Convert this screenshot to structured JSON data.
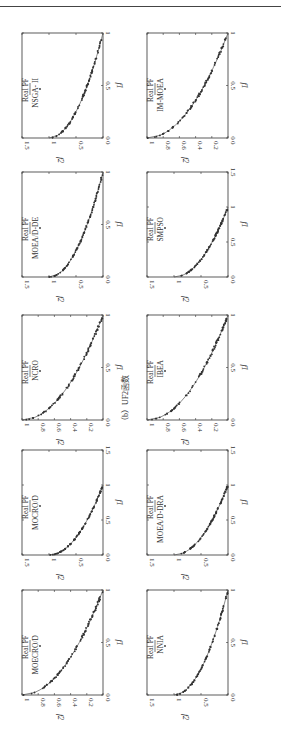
{
  "caption": "（b）UF2函数",
  "legend_line": "Real PF",
  "x_label": "f1",
  "y_label": "f2",
  "chart_data": [
    {
      "type": "scatter",
      "title": "NSGA-II",
      "legend": [
        "Real PF",
        "NSGA- II"
      ],
      "xlabel": "f1",
      "ylabel": "f2",
      "xlim": [
        0,
        1
      ],
      "ylim": [
        0,
        1.5
      ],
      "xticks": [
        "0",
        "0.5",
        "1"
      ],
      "yticks": [
        "0",
        "0.5",
        "1",
        "1.5"
      ]
    },
    {
      "type": "scatter",
      "title": "IM-MOEA",
      "legend": [
        "Real PF",
        "IM-MOEA"
      ],
      "xlabel": "f1",
      "ylabel": "f2",
      "xlim": [
        0,
        1
      ],
      "ylim": [
        0,
        1
      ],
      "xticks": [
        "0",
        "0.5",
        "1"
      ],
      "yticks": [
        "0",
        "0.2",
        "0.4",
        "0.6",
        "0.8",
        "1"
      ]
    },
    {
      "type": "scatter",
      "title": "MOEA/D-DE",
      "legend": [
        "Real PF",
        "MOEA/D-DE"
      ],
      "xlabel": "f1",
      "ylabel": "f2",
      "xlim": [
        0,
        1
      ],
      "ylim": [
        0,
        1.5
      ],
      "xticks": [
        "0",
        "0.5",
        "1"
      ],
      "yticks": [
        "0",
        "0.5",
        "1",
        "1.5"
      ]
    },
    {
      "type": "scatter",
      "title": "SMPSO",
      "legend": [
        "Real PF",
        "SMPSO"
      ],
      "xlabel": "f1",
      "ylabel": "f2",
      "xlim": [
        0,
        1.5
      ],
      "ylim": [
        0,
        1.5
      ],
      "xticks": [
        "0",
        "0.5",
        "1",
        "1.5"
      ],
      "yticks": [
        "0",
        "0.5",
        "1",
        "1.5"
      ]
    },
    {
      "type": "scatter",
      "title": "NCRO",
      "legend": [
        "Real PF",
        "NCRO"
      ],
      "xlabel": "f1",
      "ylabel": "f2",
      "xlim": [
        0,
        1
      ],
      "ylim": [
        0,
        1
      ],
      "xticks": [
        "0",
        "0.5",
        "1"
      ],
      "yticks": [
        "0",
        "0.2",
        "0.4",
        "0.6",
        "0.8",
        "1"
      ]
    },
    {
      "type": "scatter",
      "title": "IBEA",
      "legend": [
        "Real PF",
        "IBEA"
      ],
      "xlabel": "f1",
      "ylabel": "f2",
      "xlim": [
        0,
        1
      ],
      "ylim": [
        0,
        1
      ],
      "xticks": [
        "0",
        "0.5",
        "1"
      ],
      "yticks": [
        "0",
        "0.2",
        "0.4",
        "0.6",
        "0.8",
        "1"
      ]
    },
    {
      "type": "scatter",
      "title": "MOCRO/D",
      "legend": [
        "Real PF",
        "MOCRO/D"
      ],
      "xlabel": "f1",
      "ylabel": "f2",
      "xlim": [
        0,
        1.5
      ],
      "ylim": [
        0,
        1.5
      ],
      "xticks": [
        "0",
        "0.5",
        "1",
        "1.5"
      ],
      "yticks": [
        "0",
        "0.5",
        "1",
        "1.5"
      ]
    },
    {
      "type": "scatter",
      "title": "MOEA/D-DRA",
      "legend": [
        "Real PF",
        "MOEA/D-DRA"
      ],
      "xlabel": "f1",
      "ylabel": "f2",
      "xlim": [
        0,
        1.5
      ],
      "ylim": [
        0,
        1.5
      ],
      "xticks": [
        "0",
        "0.5",
        "1",
        "1.5"
      ],
      "yticks": [
        "0",
        "0.5",
        "1",
        "1.5"
      ]
    },
    {
      "type": "scatter",
      "title": "MOECRO/D",
      "legend": [
        "Real PF",
        "MOECRO/D"
      ],
      "xlabel": "f1",
      "ylabel": "f2",
      "xlim": [
        0,
        1
      ],
      "ylim": [
        0,
        1
      ],
      "xticks": [
        "0",
        "0.5",
        "1"
      ],
      "yticks": [
        "0",
        "0.2",
        "0.4",
        "0.6",
        "0.8",
        "1"
      ]
    },
    {
      "type": "scatter",
      "title": "NNIA",
      "legend": [
        "Real PF",
        "NNIA"
      ],
      "xlabel": "f1",
      "ylabel": "f2",
      "xlim": [
        0,
        1
      ],
      "ylim": [
        0,
        1.5
      ],
      "xticks": [
        "0",
        "0.5",
        "1"
      ],
      "yticks": [
        "0",
        "0.5",
        "1",
        "1.5"
      ]
    }
  ],
  "panels": [
    {
      "name": "NSGA- II",
      "col": 0,
      "row": 0,
      "xmax": 1,
      "ymax": 1.5,
      "xt": [
        "0",
        "0.5",
        "1"
      ],
      "yt": [
        "0",
        "0.5",
        "1",
        "1.5"
      ]
    },
    {
      "name": "IM-MOEA",
      "col": 1,
      "row": 0,
      "xmax": 1,
      "ymax": 1,
      "xt": [
        "0",
        "0.5",
        "1"
      ],
      "yt": [
        "0",
        "0.2",
        "0.4",
        "0.6",
        "0.8",
        "1"
      ]
    },
    {
      "name": "MOEA/D-DE",
      "col": 0,
      "row": 1,
      "xmax": 1,
      "ymax": 1.5,
      "xt": [
        "0",
        "0.5",
        "1"
      ],
      "yt": [
        "0",
        "0.5",
        "1",
        "1.5"
      ]
    },
    {
      "name": "SMPSO",
      "col": 1,
      "row": 1,
      "xmax": 1.5,
      "ymax": 1.5,
      "xt": [
        "0",
        "0.5",
        "1",
        "1.5"
      ],
      "yt": [
        "0",
        "0.5",
        "1",
        "1.5"
      ]
    },
    {
      "name": "NCRO",
      "col": 0,
      "row": 2,
      "xmax": 1,
      "ymax": 1,
      "xt": [
        "0",
        "0.5",
        "1"
      ],
      "yt": [
        "0",
        "0.2",
        "0.4",
        "0.6",
        "0.8",
        "1"
      ]
    },
    {
      "name": "IBEA",
      "col": 1,
      "row": 2,
      "xmax": 1,
      "ymax": 1,
      "xt": [
        "0",
        "0.5",
        "1"
      ],
      "yt": [
        "0",
        "0.2",
        "0.4",
        "0.6",
        "0.8",
        "1"
      ]
    },
    {
      "name": "MOCRO/D",
      "col": 0,
      "row": 3,
      "xmax": 1.5,
      "ymax": 1.5,
      "xt": [
        "0",
        "0.5",
        "1",
        "1.5"
      ],
      "yt": [
        "0",
        "0.5",
        "1",
        "1.5"
      ]
    },
    {
      "name": "MOEA/D-DRA",
      "col": 1,
      "row": 3,
      "xmax": 1.5,
      "ymax": 1.5,
      "xt": [
        "0",
        "0.5",
        "1",
        "1.5"
      ],
      "yt": [
        "0",
        "0.5",
        "1",
        "1.5"
      ]
    },
    {
      "name": "MOECRO/D",
      "col": 0,
      "row": 4,
      "xmax": 1,
      "ymax": 1,
      "xt": [
        "0",
        "0.5",
        "1"
      ],
      "yt": [
        "0",
        "0.2",
        "0.4",
        "0.6",
        "0.8",
        "1"
      ]
    },
    {
      "name": "NNIA",
      "col": 1,
      "row": 4,
      "xmax": 1,
      "ymax": 1.5,
      "xt": [
        "0",
        "0.5",
        "1"
      ],
      "yt": [
        "0",
        "0.5",
        "1",
        "1.5"
      ]
    }
  ]
}
